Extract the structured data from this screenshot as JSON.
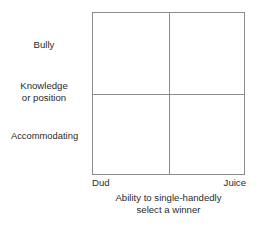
{
  "figure": {
    "type": "2x2-quadrant-matrix",
    "background_color": "#ffffff",
    "line_color": "#8c8c8c",
    "text_color": "#2b2b2b"
  },
  "y_axis": {
    "labels": [
      {
        "text": "Bully"
      },
      {
        "line1": "Knowledge",
        "line2": "or position"
      },
      {
        "text": "Accommodating"
      }
    ]
  },
  "x_axis": {
    "low_label": "Dud",
    "high_label": "Juice",
    "title_line1": "Ability to single-handedly",
    "title_line2": "select a winner"
  },
  "quadrants": [
    {
      "name": "top-left",
      "text": ""
    },
    {
      "name": "top-right",
      "text": ""
    },
    {
      "name": "bottom-left",
      "text": ""
    },
    {
      "name": "bottom-right",
      "text": ""
    }
  ],
  "chart_data": {
    "type": "scatter",
    "title": "",
    "subtitle": "",
    "xlabel": "Ability to single-handedly select a winner",
    "ylabel": "",
    "x_tick_labels": [
      "Dud",
      "Juice"
    ],
    "y_tick_labels": [
      "Bully",
      "Knowledge or position",
      "Accommodating"
    ],
    "x": [],
    "y": [],
    "series": [],
    "annotations": [],
    "grid": true,
    "legend": false,
    "xlim": [
      0,
      1
    ],
    "ylim": [
      0,
      1
    ],
    "quadrant_divider_x": 0.5,
    "quadrant_divider_y": 0.5,
    "note": "Empty 2x2 framework: vertical axis is categorical (Bully / Knowledge or position / Accommodating) and horizontal axis runs from Dud to Juice. No data points are plotted."
  }
}
